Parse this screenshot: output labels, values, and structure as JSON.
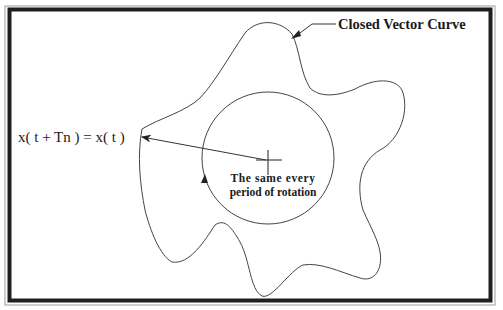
{
  "figure": {
    "curve_label": "Closed Vector Curve",
    "equation_label": "x( t + Tn ) = x( t )",
    "center_label_line1": "The same every",
    "center_label_line2": "period of rotation"
  },
  "colors": {
    "line": "#333333",
    "frame": "#1f1f1f",
    "background": "#ffffff"
  }
}
